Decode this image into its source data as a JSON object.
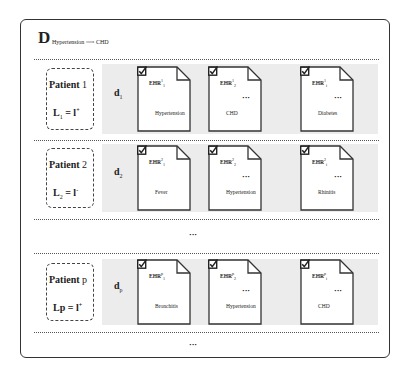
{
  "title": {
    "main": "D",
    "subscript": "Hypertension ⟶ CHD"
  },
  "rows": [
    {
      "patient_label": "Patient",
      "patient_num": "1",
      "label_eq": "L",
      "label_sub": "1",
      "label_rhs": " = l",
      "label_sup": "+",
      "doc_var": "d",
      "doc_sub": "1",
      "docs": [
        {
          "ehr": "EHR",
          "sup": "1",
          "sub": "1",
          "condition": "Hypertension"
        },
        {
          "ehr": "EHR",
          "sup": "1",
          "sub": "2",
          "condition": "CHD"
        },
        {
          "ehr": "EHR",
          "sup": "1",
          "sub": "i",
          "condition": "Diabetes"
        }
      ]
    },
    {
      "patient_label": "Patient",
      "patient_num": "2",
      "label_eq": "L",
      "label_sub": "2",
      "label_rhs": " = l",
      "label_sup": "-",
      "doc_var": "d",
      "doc_sub": "2",
      "docs": [
        {
          "ehr": "EHR",
          "sup": "2",
          "sub": "1",
          "condition": "Fever"
        },
        {
          "ehr": "EHR",
          "sup": "2",
          "sub": "2",
          "condition": "Hypertension"
        },
        {
          "ehr": "EHR",
          "sup": "2",
          "sub": "i",
          "condition": "Rhinitis"
        }
      ]
    },
    {
      "patient_label": "Patient",
      "patient_num": "p",
      "label_eq": "Lp",
      "label_sub": "",
      "label_rhs": " = l",
      "label_sup": "+",
      "doc_var": "d",
      "doc_sub": "p",
      "docs": [
        {
          "ehr": "EHR",
          "sup": "p",
          "sub": "1",
          "condition": "Bronchitis"
        },
        {
          "ehr": "EHR",
          "sup": "p",
          "sub": "2",
          "condition": "Hypertension"
        },
        {
          "ehr": "EHR",
          "sup": "p",
          "sub": "i",
          "condition": "CHD"
        }
      ]
    }
  ],
  "ellipsis": "···"
}
